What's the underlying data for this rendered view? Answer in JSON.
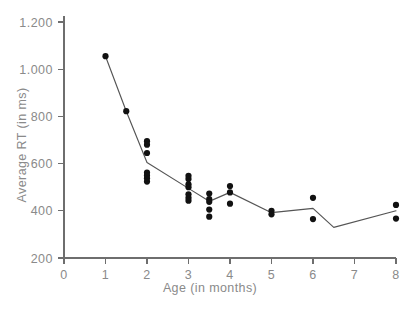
{
  "chart_data": {
    "type": "scatter",
    "title": "",
    "xlabel": "Age (in months)",
    "ylabel": "Average RT (in ms)",
    "xlim": [
      0,
      8
    ],
    "ylim": [
      200,
      1200
    ],
    "xticks": [
      0,
      1,
      2,
      3,
      4,
      5,
      6,
      7,
      8
    ],
    "xticklabels": [
      "0",
      "1",
      "2",
      "3",
      "4",
      "5",
      "6",
      "7",
      "8"
    ],
    "yticks": [
      200,
      400,
      600,
      800,
      1000,
      1200
    ],
    "yticklabels": [
      "200",
      "400",
      "600",
      "800",
      "1.000",
      "1.200"
    ],
    "grid": false,
    "legend": null,
    "point_color": "#111111",
    "line_color": "#555555",
    "axis_color": "#6e6e6e",
    "label_color": "#8a8a8a",
    "points": [
      {
        "x": 1,
        "y": 1055
      },
      {
        "x": 1.5,
        "y": 822
      },
      {
        "x": 2,
        "y": 695
      },
      {
        "x": 2,
        "y": 680
      },
      {
        "x": 2,
        "y": 645
      },
      {
        "x": 2,
        "y": 562
      },
      {
        "x": 2,
        "y": 550
      },
      {
        "x": 2,
        "y": 538
      },
      {
        "x": 2,
        "y": 524
      },
      {
        "x": 3,
        "y": 548
      },
      {
        "x": 3,
        "y": 535
      },
      {
        "x": 3,
        "y": 512
      },
      {
        "x": 3,
        "y": 500
      },
      {
        "x": 3,
        "y": 470
      },
      {
        "x": 3,
        "y": 455
      },
      {
        "x": 3,
        "y": 443
      },
      {
        "x": 3.5,
        "y": 473
      },
      {
        "x": 3.5,
        "y": 450
      },
      {
        "x": 3.5,
        "y": 438
      },
      {
        "x": 3.5,
        "y": 405
      },
      {
        "x": 3.5,
        "y": 375
      },
      {
        "x": 4,
        "y": 505
      },
      {
        "x": 4,
        "y": 478
      },
      {
        "x": 4,
        "y": 430
      },
      {
        "x": 5,
        "y": 400
      },
      {
        "x": 5,
        "y": 385
      },
      {
        "x": 6,
        "y": 455
      },
      {
        "x": 6,
        "y": 365
      },
      {
        "x": 8,
        "y": 425
      },
      {
        "x": 8,
        "y": 367
      }
    ],
    "mean_line": [
      {
        "x": 1,
        "y": 1055
      },
      {
        "x": 1.5,
        "y": 822
      },
      {
        "x": 2,
        "y": 605
      },
      {
        "x": 3,
        "y": 495
      },
      {
        "x": 3.5,
        "y": 440
      },
      {
        "x": 4,
        "y": 478
      },
      {
        "x": 5,
        "y": 392
      },
      {
        "x": 6,
        "y": 410
      },
      {
        "x": 6.5,
        "y": 330
      },
      {
        "x": 8,
        "y": 400
      }
    ]
  }
}
